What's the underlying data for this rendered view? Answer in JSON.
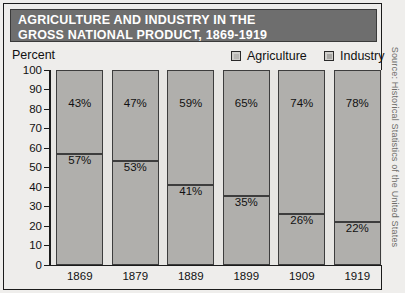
{
  "title": {
    "line1": "AGRICULTURE AND INDUSTRY IN THE",
    "line2": "GROSS NATIONAL PRODUCT, 1869-1919"
  },
  "axis": {
    "y_title": "Percent"
  },
  "legend": {
    "agriculture": "Agriculture",
    "industry": "Industry"
  },
  "source_credit": "Source: Historical Statistics of the United States",
  "colors": {
    "title_bar": "#6e6e6e",
    "title_text": "#ffffff",
    "bar_fill": "#b0afac",
    "bar_outline": "#3d3d3d",
    "plot_background": "#e7e6e3",
    "page_background": "#eeedeb",
    "axis": "#1b1b1b"
  },
  "chart_data": {
    "type": "bar",
    "title": "AGRICULTURE AND INDUSTRY IN THE GROSS NATIONAL PRODUCT, 1869-1919",
    "xlabel": "",
    "ylabel": "Percent",
    "ylim": [
      0,
      100
    ],
    "yticks": [
      0,
      10,
      20,
      30,
      40,
      50,
      60,
      70,
      80,
      90,
      100
    ],
    "ytick_labels": [
      "0",
      "10",
      "20",
      "30",
      "40",
      "50",
      "60",
      "70",
      "80",
      "90",
      "100"
    ],
    "grid": false,
    "stacked": true,
    "legend_position": "top-right",
    "categories": [
      "1869",
      "1879",
      "1889",
      "1899",
      "1909",
      "1919"
    ],
    "series": [
      {
        "name": "Agriculture",
        "values": [
          57,
          53,
          41,
          35,
          26,
          22
        ],
        "labels": [
          "57%",
          "53%",
          "41%",
          "35%",
          "26%",
          "22%"
        ],
        "stack_position": "bottom"
      },
      {
        "name": "Industry",
        "values": [
          43,
          47,
          59,
          65,
          74,
          78
        ],
        "labels": [
          "43%",
          "47%",
          "59%",
          "65%",
          "74%",
          "78%"
        ],
        "stack_position": "top"
      }
    ]
  }
}
